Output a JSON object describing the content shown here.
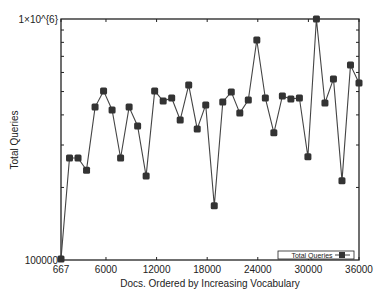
{
  "chart_data": {
    "type": "line",
    "title": "",
    "xlabel": "Docs. Ordered by Increasing Vocabulary",
    "ylabel": "Total Queries",
    "yscale": "log",
    "xlim": [
      667,
      36000
    ],
    "ylim": [
      100000,
      1000000
    ],
    "x_ticks": [
      "667",
      "6000",
      "12000",
      "18000",
      "24000",
      "30000",
      "36000"
    ],
    "y_ticks": [
      "100000",
      "1x10^{6}"
    ],
    "grid": false,
    "legend_position": "lower right",
    "series": [
      {
        "name": "Total Queries",
        "marker": "square",
        "color": "#333333",
        "x": [
          667,
          1677,
          2686,
          3696,
          4705,
          5715,
          6724,
          7734,
          8743,
          9753,
          10762,
          11772,
          12781,
          13791,
          14800,
          15810,
          16819,
          17829,
          18838,
          19848,
          20857,
          21867,
          22876,
          23886,
          24895,
          25905,
          26914,
          27924,
          28933,
          29943,
          30952,
          31962,
          32971,
          33981,
          34990,
          36000
        ],
        "values": [
          101000,
          265000,
          265000,
          236000,
          431000,
          503000,
          419000,
          265000,
          431000,
          360000,
          223000,
          503000,
          457000,
          470000,
          381000,
          532000,
          350000,
          440000,
          168000,
          453000,
          498000,
          407000,
          461000,
          818000,
          470000,
          337000,
          479000,
          466000,
          470000,
          268000,
          1000000,
          448000,
          564000,
          213000,
          644000,
          542000
        ]
      }
    ]
  },
  "legend": {
    "label": "Total Queries"
  }
}
